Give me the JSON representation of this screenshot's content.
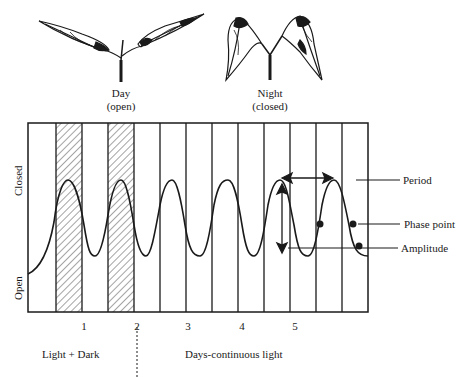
{
  "plants": {
    "day": {
      "title": "Day",
      "state": "(open)"
    },
    "night": {
      "title": "Night",
      "state": "(closed)"
    }
  },
  "axis": {
    "y_top": "Closed",
    "y_bottom": "Open",
    "x_ticks": [
      "1",
      "2",
      "3",
      "4",
      "5"
    ]
  },
  "annotations": {
    "period": "Period",
    "phase_point": "Phase point",
    "amplitude": "Amplitude"
  },
  "footer": {
    "left": "Light + Dark",
    "right": "Days-continuous light"
  },
  "colors": {
    "ink": "#1a1a1a",
    "background": "#ffffff"
  }
}
